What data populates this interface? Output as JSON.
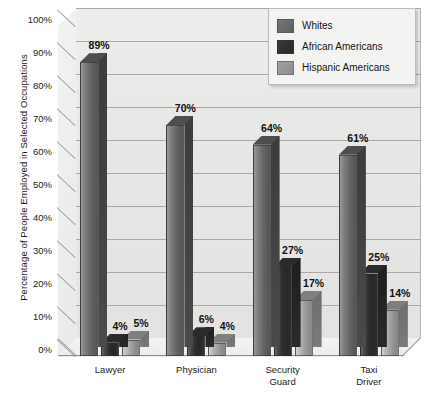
{
  "chart_data": {
    "type": "bar",
    "title": "",
    "xlabel": "",
    "ylabel": "Percentage of People Employed in Selected Occupations",
    "categories": [
      "Lawyer",
      "Physician",
      "Security\nGuard",
      "Taxi\nDriver"
    ],
    "series": [
      {
        "name": "Whites",
        "values": [
          89,
          70,
          64,
          61
        ],
        "color": "#6d6d6d"
      },
      {
        "name": "African Americans",
        "values": [
          4,
          6,
          27,
          25
        ],
        "color": "#2e2e2e"
      },
      {
        "name": "Hispanic Americans",
        "values": [
          5,
          4,
          17,
          14
        ],
        "color": "#a3a3a3"
      }
    ],
    "value_labels": [
      [
        "89%",
        "4%",
        "5%"
      ],
      [
        "70%",
        "6%",
        "4%"
      ],
      [
        "64%",
        "27%",
        "17%"
      ],
      [
        "61%",
        "25%",
        "14%"
      ]
    ],
    "ylim": [
      0,
      100
    ],
    "ytick_labels": [
      "100%",
      "90%",
      "80%",
      "70%",
      "60%",
      "50%",
      "40%",
      "30%",
      "20%",
      "10%",
      "0%"
    ],
    "ytick_values": [
      100,
      90,
      80,
      70,
      60,
      50,
      40,
      30,
      20,
      10,
      0
    ],
    "grid": true,
    "legend_position": "top-right",
    "legend_entries": [
      "Whites",
      "African Americans",
      "Hispanic Americans"
    ],
    "style": "3d-bar",
    "background_color": "#e7e7e6",
    "gridline_color": "#a8a8a8"
  }
}
